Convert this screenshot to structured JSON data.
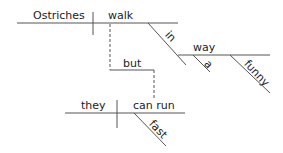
{
  "diagram": {
    "type": "sentence-diagram",
    "clause1": {
      "subject": "Ostriches",
      "verb": "walk",
      "modifiers": {
        "preposition": "in",
        "object": "way",
        "object_modifiers": [
          "a",
          "funny"
        ]
      }
    },
    "conjunction": "but",
    "clause2": {
      "subject": "they",
      "verb": "can run",
      "modifiers": [
        "fast"
      ]
    },
    "line_color": "#555555",
    "text_color": "#222222"
  }
}
